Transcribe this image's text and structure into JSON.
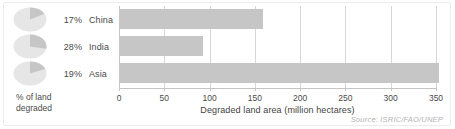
{
  "chart_data": {
    "type": "bar",
    "orientation": "horizontal",
    "categories": [
      "China",
      "India",
      "Asia"
    ],
    "values": [
      159,
      93,
      353
    ],
    "title": "",
    "xlabel": "Degraded land area (million hectares)",
    "ylabel": "",
    "xlim": [
      0,
      350
    ],
    "xticks": [
      0,
      50,
      100,
      150,
      200,
      250,
      300,
      350
    ],
    "xticklabels": [
      "0",
      "50",
      "100",
      "150",
      "200",
      "250",
      "300",
      "350"
    ],
    "grid": true,
    "legend": false,
    "bar_color": "#c6c6c6",
    "series": [
      {
        "name": "Degraded land area (million hectares)",
        "values": [
          159,
          93,
          353
        ]
      }
    ],
    "secondary": {
      "type": "pie",
      "label": "% of land degraded",
      "caption": "% of land\ndegraded",
      "slice_color": "#c6c6c6",
      "rest_color": "#e6e6e6",
      "items": [
        {
          "category": "China",
          "percent": 17,
          "percent_label": "17%"
        },
        {
          "category": "India",
          "percent": 28,
          "percent_label": "28%"
        },
        {
          "category": "Asia",
          "percent": 19,
          "percent_label": "19%"
        }
      ]
    },
    "annotations": [
      "Source: ISRIC/FAO/UNEP"
    ],
    "source": "Source: ISRIC/FAO/UNEP"
  },
  "figure": {
    "rows": [
      {
        "percent_label": "17%",
        "country": "China"
      },
      {
        "percent_label": "28%",
        "country": "India"
      },
      {
        "percent_label": "19%",
        "country": "Asia"
      }
    ],
    "pct_caption": "% of land\ndegraded",
    "xlabel": "Degraded land area (million hectares)",
    "source": "Source: ISRIC/FAO/UNEP",
    "ticks": [
      "0",
      "50",
      "100",
      "150",
      "200",
      "250",
      "300",
      "350"
    ]
  },
  "colors": {
    "bar": "#c6c6c6",
    "pie_slice": "#c6c6c6",
    "pie_rest": "#e6e6e6",
    "grid": "#d6d6d6",
    "text": "#4a4a4a",
    "source_text": "#b3b3b3",
    "background": "#ffffff",
    "frame": "#ececec"
  }
}
